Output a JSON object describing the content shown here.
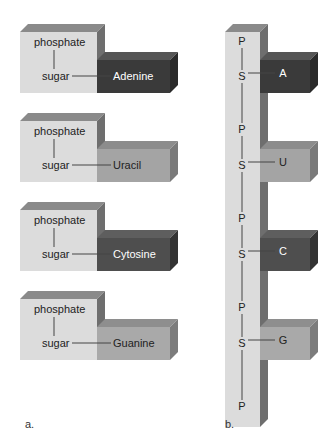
{
  "panel_a": {
    "label": "a.",
    "nucleotides": [
      {
        "phosphate": "phosphate",
        "sugar": "sugar",
        "base": "Adenine",
        "base_color": "#3a3a3a",
        "base_top": "#555555",
        "base_side": "#2a2a2a",
        "text_color": "#ffffff"
      },
      {
        "phosphate": "phosphate",
        "sugar": "sugar",
        "base": "Uracil",
        "base_color": "#a4a4a4",
        "base_top": "#8c8c8c",
        "base_side": "#7a7a7a",
        "text_color": "#222222"
      },
      {
        "phosphate": "phosphate",
        "sugar": "sugar",
        "base": "Cytosine",
        "base_color": "#4e4e4e",
        "base_top": "#5e5e5e",
        "base_side": "#333333",
        "text_color": "#ffffff"
      },
      {
        "phosphate": "phosphate",
        "sugar": "sugar",
        "base": "Guanine",
        "base_color": "#a9a9a9",
        "base_top": "#8e8e8e",
        "base_side": "#7c7c7c",
        "text_color": "#222222"
      }
    ]
  },
  "panel_b": {
    "label": "b.",
    "backbone": [
      "P",
      "S",
      "P",
      "S",
      "P",
      "S",
      "P",
      "S",
      "P"
    ],
    "bases": [
      {
        "letter": "A",
        "color": "#3a3a3a",
        "top": "#555555",
        "side": "#2a2a2a",
        "text_color": "#ffffff"
      },
      {
        "letter": "U",
        "color": "#a4a4a4",
        "top": "#8c8c8c",
        "side": "#7a7a7a",
        "text_color": "#222222"
      },
      {
        "letter": "C",
        "color": "#4e4e4e",
        "top": "#5e5e5e",
        "side": "#333333",
        "text_color": "#ffffff"
      },
      {
        "letter": "G",
        "color": "#a9a9a9",
        "top": "#8e8e8e",
        "side": "#7c7c7c",
        "text_color": "#222222"
      }
    ]
  },
  "colors": {
    "sugar_face": "#dcdcdc",
    "sugar_top": "#8a8a8a",
    "sugar_side": "#6e6e6e",
    "line": "#444444",
    "text": "#222222"
  }
}
